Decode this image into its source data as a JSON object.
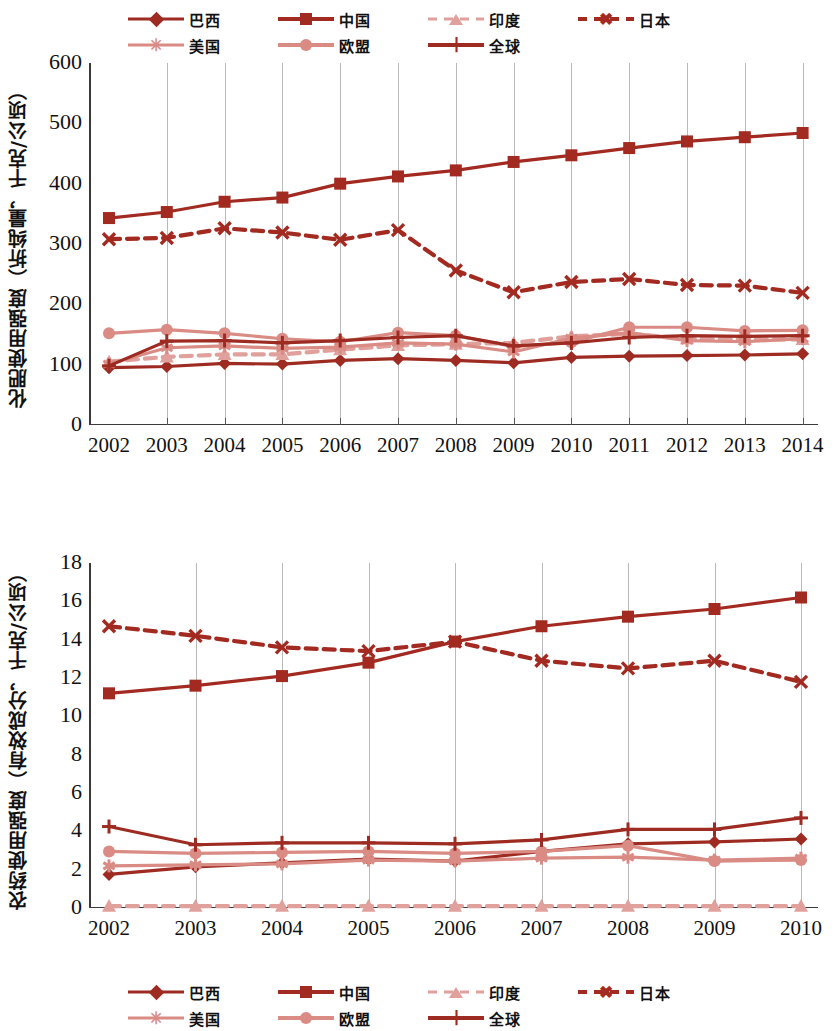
{
  "legend": {
    "items": [
      {
        "label": "巴西",
        "marker": "diamond",
        "color": "#9e2b22",
        "dash": "solid",
        "weight": "normal"
      },
      {
        "label": "中国",
        "marker": "square",
        "color": "#a32a20",
        "dash": "solid",
        "weight": "bold"
      },
      {
        "label": "印度",
        "marker": "triangle",
        "color": "#e0a09c",
        "dash": "dashed",
        "weight": "normal"
      },
      {
        "label": "日本",
        "marker": "x",
        "color": "#a32a20",
        "dash": "dashed",
        "weight": "bold"
      },
      {
        "label": "美国",
        "marker": "star",
        "color": "#d98b84",
        "dash": "solid",
        "weight": "normal"
      },
      {
        "label": "欧盟",
        "marker": "circle",
        "color": "#d98b84",
        "dash": "solid",
        "weight": "bold"
      },
      {
        "label": "全球",
        "marker": "plus",
        "color": "#9e2b22",
        "dash": "solid",
        "weight": "bold"
      }
    ]
  },
  "chart_data": [
    {
      "id": "fertilizer",
      "type": "line",
      "title": "",
      "xlabel": "",
      "ylabel": "化肥使用强度（折纯量，千克/公顷）",
      "x": [
        2002,
        2003,
        2004,
        2005,
        2006,
        2007,
        2008,
        2009,
        2010,
        2011,
        2012,
        2013,
        2014
      ],
      "xticklabels": [
        "2002",
        "2003",
        "2004",
        "2005",
        "2006",
        "2007",
        "2008",
        "2009",
        "2010",
        "2011",
        "2012",
        "2013",
        "2014"
      ],
      "ylim": [
        0,
        600
      ],
      "yticks": [
        0,
        100,
        200,
        300,
        400,
        500,
        600
      ],
      "grid": "vertical",
      "legend_position": "top",
      "series": [
        {
          "name": "巴西",
          "marker": "diamond",
          "color": "#9e2b22",
          "dash": "solid",
          "values": [
            95,
            97,
            102,
            101,
            107,
            110,
            107,
            103,
            112,
            114,
            115,
            116,
            118
          ]
        },
        {
          "name": "中国",
          "marker": "square",
          "color": "#a32a20",
          "dash": "solid",
          "values": [
            343,
            353,
            370,
            377,
            400,
            412,
            422,
            436,
            447,
            459,
            470,
            477,
            484
          ]
        },
        {
          "name": "印度",
          "marker": "triangle",
          "color": "#e0a09c",
          "dash": "dashed",
          "values": [
            105,
            113,
            117,
            117,
            125,
            132,
            134,
            136,
            147,
            151,
            143,
            142,
            142
          ]
        },
        {
          "name": "日本",
          "marker": "x",
          "color": "#a32a20",
          "dash": "dashed",
          "values": [
            308,
            310,
            326,
            319,
            307,
            323,
            256,
            220,
            237,
            242,
            232,
            231,
            219
          ]
        },
        {
          "name": "美国",
          "marker": "star",
          "color": "#d98b84",
          "dash": "solid",
          "values": [
            101,
            128,
            131,
            127,
            129,
            136,
            134,
            121,
            144,
            153,
            140,
            138,
            143
          ]
        },
        {
          "name": "欧盟",
          "marker": "circle",
          "color": "#d98b84",
          "dash": "solid",
          "values": [
            152,
            158,
            152,
            143,
            138,
            153,
            148,
            130,
            137,
            162,
            162,
            156,
            157
          ]
        },
        {
          "name": "全球",
          "marker": "plus",
          "color": "#9e2b22",
          "dash": "solid",
          "values": [
            98,
            139,
            140,
            136,
            140,
            145,
            148,
            131,
            136,
            145,
            148,
            147,
            148
          ]
        }
      ]
    },
    {
      "id": "pesticide",
      "type": "line",
      "title": "",
      "xlabel": "",
      "ylabel": "农药使用强度（有效成分，千克/公顷）",
      "x": [
        2002,
        2003,
        2004,
        2005,
        2006,
        2007,
        2008,
        2009,
        2010
      ],
      "xticklabels": [
        "2002",
        "2003",
        "2004",
        "2005",
        "2006",
        "2007",
        "2008",
        "2009",
        "2010"
      ],
      "ylim": [
        0,
        18
      ],
      "yticks": [
        0,
        2,
        4,
        6,
        8,
        10,
        12,
        14,
        16,
        18
      ],
      "grid": "vertical",
      "legend_position": "top",
      "series": [
        {
          "name": "巴西",
          "marker": "diamond",
          "color": "#9e2b22",
          "dash": "solid",
          "values": [
            1.75,
            2.15,
            2.35,
            2.55,
            2.45,
            2.95,
            3.35,
            3.45,
            3.6
          ]
        },
        {
          "name": "中国",
          "marker": "square",
          "color": "#a32a20",
          "dash": "solid",
          "values": [
            11.2,
            11.6,
            12.1,
            12.8,
            13.9,
            14.7,
            15.2,
            15.6,
            16.2
          ]
        },
        {
          "name": "印度",
          "marker": "triangle",
          "color": "#e0a09c",
          "dash": "dashed",
          "values": [
            0.1,
            0.1,
            0.1,
            0.1,
            0.1,
            0.1,
            0.1,
            0.1,
            0.1
          ]
        },
        {
          "name": "日本",
          "marker": "x",
          "color": "#a32a20",
          "dash": "dashed",
          "values": [
            14.7,
            14.2,
            13.6,
            13.4,
            13.9,
            12.9,
            12.5,
            12.9,
            11.8
          ]
        },
        {
          "name": "美国",
          "marker": "star",
          "color": "#d98b84",
          "dash": "solid",
          "values": [
            2.2,
            2.25,
            2.3,
            2.5,
            2.45,
            2.6,
            2.65,
            2.5,
            2.6
          ]
        },
        {
          "name": "欧盟",
          "marker": "circle",
          "color": "#d98b84",
          "dash": "solid",
          "values": [
            2.95,
            2.85,
            2.9,
            2.95,
            2.85,
            2.95,
            3.25,
            2.45,
            2.5
          ]
        },
        {
          "name": "全球",
          "marker": "plus",
          "color": "#9e2b22",
          "dash": "solid",
          "values": [
            4.25,
            3.3,
            3.4,
            3.4,
            3.35,
            3.55,
            4.1,
            4.1,
            4.7
          ]
        }
      ]
    }
  ]
}
